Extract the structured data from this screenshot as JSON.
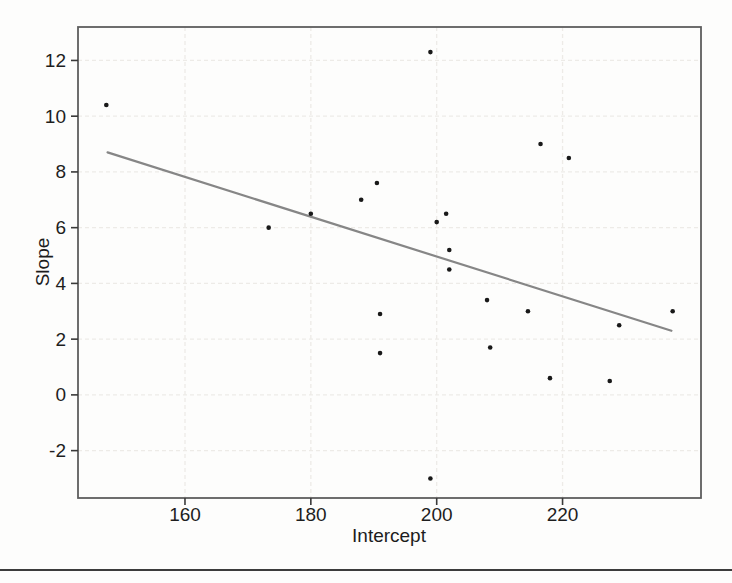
{
  "figure": {
    "background": "#fdfdfc",
    "page_rule_color": "#3c3c3c"
  },
  "chart_data": {
    "type": "scatter",
    "title": "",
    "xlabel": "Intercept",
    "ylabel": "Slope",
    "xlim": [
      143,
      242
    ],
    "ylim": [
      -3.7,
      13.2
    ],
    "x_ticks": [
      160,
      180,
      200,
      220
    ],
    "y_ticks": [
      -2,
      0,
      2,
      4,
      6,
      8,
      10,
      12
    ],
    "grid": true,
    "legend": "none",
    "points": [
      [
        147.5,
        10.4
      ],
      [
        173.3,
        6.0
      ],
      [
        180,
        6.5
      ],
      [
        188,
        7.0
      ],
      [
        190.5,
        7.6
      ],
      [
        191,
        2.9
      ],
      [
        191,
        1.5
      ],
      [
        199,
        12.3
      ],
      [
        199,
        -3.0
      ],
      [
        200,
        6.2
      ],
      [
        201.5,
        6.5
      ],
      [
        202,
        5.2
      ],
      [
        202,
        4.5
      ],
      [
        208,
        3.4
      ],
      [
        208.5,
        1.7
      ],
      [
        214.5,
        3.0
      ],
      [
        216.5,
        9.0
      ],
      [
        218,
        0.6
      ],
      [
        221,
        8.5
      ],
      [
        227.5,
        0.5
      ],
      [
        229,
        2.5
      ],
      [
        237.5,
        3.0
      ]
    ],
    "trend_line": {
      "x1": 147.7,
      "y1": 8.7,
      "x2": 237.3,
      "y2": 2.3
    },
    "colors": {
      "point": "#191919",
      "trend": "#868686",
      "grid": "#edebe7",
      "box": "#5e5e5e",
      "tick": "#3a3a3a",
      "text": "#1e1e1e"
    }
  }
}
